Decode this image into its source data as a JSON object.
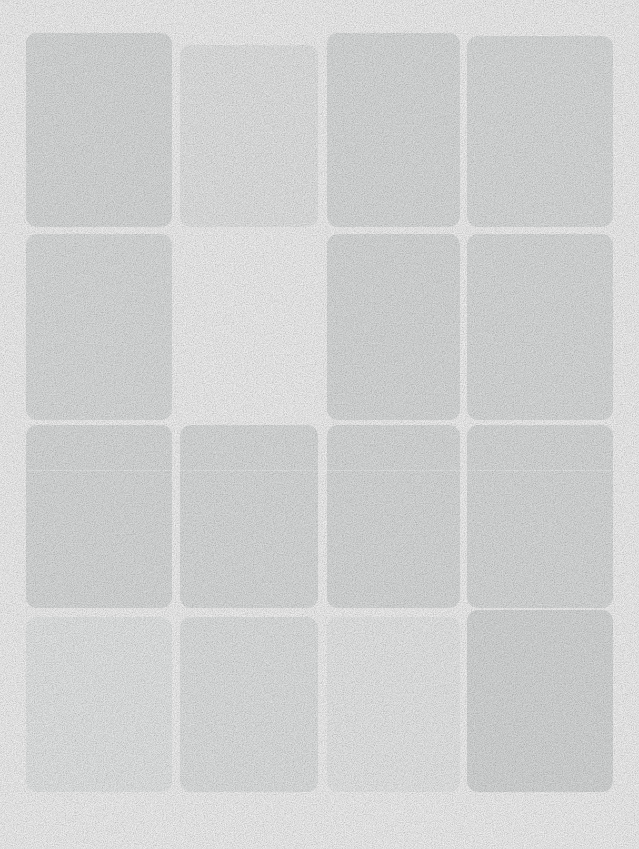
{
  "canvas": {
    "width": 639,
    "height": 849,
    "background": "#ffffff",
    "description": "Blank content-placeholder / skeleton card grid"
  },
  "grid": {
    "columns": 4,
    "rows": 4,
    "column_gap": 8,
    "row_gap": 7,
    "corner_radius": 11
  },
  "divider_color": "#f4f6f6",
  "cards": [
    {
      "row": 1,
      "col": 1,
      "x": 26,
      "y": 33,
      "w": 146,
      "h": 194,
      "color": "#e7e9e9",
      "empty": false,
      "divider": false
    },
    {
      "row": 1,
      "col": 2,
      "x": 180,
      "y": 45,
      "w": 138,
      "h": 182,
      "color": "#f2f3f3",
      "empty": false,
      "divider": false
    },
    {
      "row": 1,
      "col": 3,
      "x": 327,
      "y": 33,
      "w": 133,
      "h": 194,
      "color": "#e8eaea",
      "empty": false,
      "divider": false
    },
    {
      "row": 1,
      "col": 4,
      "x": 467,
      "y": 36,
      "w": 146,
      "h": 191,
      "color": "#e9ebeb",
      "empty": false,
      "divider": false
    },
    {
      "row": 2,
      "col": 1,
      "x": 26,
      "y": 234,
      "w": 146,
      "h": 186,
      "color": "#e9ebeb",
      "empty": false,
      "divider": false
    },
    {
      "row": 2,
      "col": 2,
      "x": 180,
      "y": 234,
      "w": 138,
      "h": 186,
      "color": "#ffffff",
      "empty": true,
      "divider": false
    },
    {
      "row": 2,
      "col": 3,
      "x": 327,
      "y": 234,
      "w": 133,
      "h": 186,
      "color": "#e7e9e9",
      "empty": false,
      "divider": false
    },
    {
      "row": 2,
      "col": 4,
      "x": 467,
      "y": 234,
      "w": 146,
      "h": 186,
      "color": "#e8eaea",
      "empty": false,
      "divider": false
    },
    {
      "row": 3,
      "col": 1,
      "x": 26,
      "y": 425,
      "w": 146,
      "h": 183,
      "color": "#e7e9e9",
      "empty": false,
      "divider": true
    },
    {
      "row": 3,
      "col": 2,
      "x": 180,
      "y": 425,
      "w": 138,
      "h": 183,
      "color": "#e8eaea",
      "empty": false,
      "divider": true
    },
    {
      "row": 3,
      "col": 3,
      "x": 327,
      "y": 425,
      "w": 133,
      "h": 183,
      "color": "#e7e9e9",
      "empty": false,
      "divider": true
    },
    {
      "row": 3,
      "col": 4,
      "x": 467,
      "y": 425,
      "w": 146,
      "h": 183,
      "color": "#e7e9e9",
      "empty": false,
      "divider": true
    },
    {
      "row": 4,
      "col": 1,
      "x": 26,
      "y": 617,
      "w": 146,
      "h": 175,
      "color": "#f3f5f5",
      "empty": false,
      "divider": false
    },
    {
      "row": 4,
      "col": 2,
      "x": 180,
      "y": 617,
      "w": 138,
      "h": 175,
      "color": "#eef0f0",
      "empty": false,
      "divider": false
    },
    {
      "row": 4,
      "col": 3,
      "x": 327,
      "y": 617,
      "w": 133,
      "h": 175,
      "color": "#f6f7f7",
      "empty": false,
      "divider": false
    },
    {
      "row": 4,
      "col": 4,
      "x": 467,
      "y": 610,
      "w": 146,
      "h": 182,
      "color": "#e4e6e6",
      "empty": false,
      "divider": false
    }
  ],
  "card_divider_offset": 45
}
